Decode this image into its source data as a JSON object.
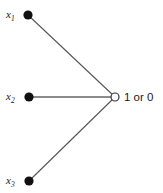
{
  "diagram": {
    "type": "perceptron-threshold-unit",
    "background_color": "#ffffff",
    "edge_color": "#555555",
    "node_fill_color": "#111111",
    "output_node_fill_color": "#ffffff",
    "output_node_stroke_color": "#333333",
    "inputs": [
      {
        "id": "x1",
        "base": "x",
        "subscript": "1",
        "node_x": 28,
        "node_y": 15,
        "label_x": 6,
        "label_y": 18
      },
      {
        "id": "x2",
        "base": "x",
        "subscript": "2",
        "node_x": 29,
        "node_y": 97,
        "label_x": 6,
        "label_y": 100
      },
      {
        "id": "x3",
        "base": "x",
        "subscript": "3",
        "node_x": 29,
        "node_y": 181,
        "label_x": 6,
        "label_y": 184
      }
    ],
    "output": {
      "id": "output",
      "node_x": 115,
      "node_y": 97,
      "label": "1 or 0",
      "label_x": 124,
      "label_y": 101
    },
    "edges": [
      {
        "from": "x1",
        "to": "output"
      },
      {
        "from": "x2",
        "to": "output"
      },
      {
        "from": "x3",
        "to": "output"
      }
    ]
  }
}
